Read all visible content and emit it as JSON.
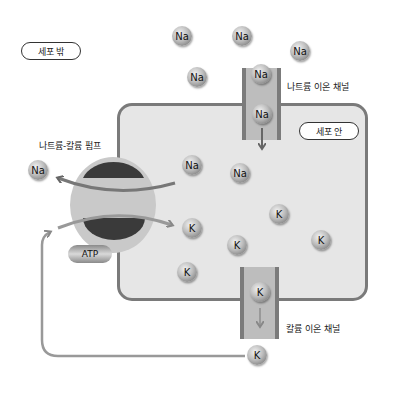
{
  "labels": {
    "outside_cell": "세포 밖",
    "inside_cell": "세포 안",
    "sodium_potassium_pump": "나트륨-칼륨 펌프",
    "sodium_ion_channel": "나트륨 이온 채널",
    "potassium_ion_channel": "칼륨 이온 채널",
    "atp": "ATP"
  },
  "ions": {
    "outside_sodium": [
      "Na",
      "Na",
      "Na",
      "Na",
      "Na"
    ],
    "sodium_channel": [
      "Na",
      "Na"
    ],
    "pump_released_sodium": "Na",
    "inside_sodium": [
      "Na",
      "Na"
    ],
    "inside_potassium": [
      "K",
      "K",
      "K",
      "K",
      "K"
    ],
    "potassium_channel": "K",
    "outside_potassium": "K"
  },
  "colors": {
    "cell_fill": "#e6e6e6",
    "membrane": "#7a7a7a",
    "pump_dark": "#3a3a3a",
    "pump_light": "#c8c8c8",
    "arrow": "#888888"
  }
}
